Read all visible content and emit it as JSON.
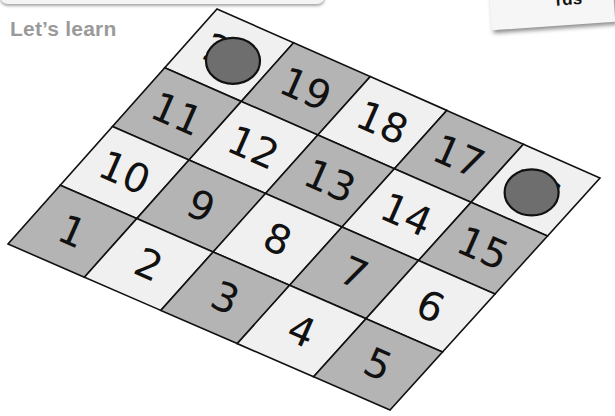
{
  "header": {
    "title": "Let’s learn",
    "card_text": "rds"
  },
  "board": {
    "columns": 5,
    "rows": 4,
    "corners": {
      "top": [
        217,
        9
      ],
      "right": [
        600,
        178
      ],
      "bottom": [
        390,
        410
      ],
      "left": [
        8,
        244
      ]
    },
    "colors": {
      "light": "#f0f0f0",
      "dark": "#b4b4b4",
      "line": "#111111",
      "counter": "#6e6e6e"
    },
    "cells": [
      [
        {
          "n": "20",
          "shade": "light"
        },
        {
          "n": "19",
          "shade": "dark"
        },
        {
          "n": "18",
          "shade": "light"
        },
        {
          "n": "17",
          "shade": "dark"
        },
        {
          "n": "16",
          "shade": "light"
        }
      ],
      [
        {
          "n": "11",
          "shade": "dark"
        },
        {
          "n": "12",
          "shade": "light"
        },
        {
          "n": "13",
          "shade": "dark"
        },
        {
          "n": "14",
          "shade": "light"
        },
        {
          "n": "15",
          "shade": "dark"
        }
      ],
      [
        {
          "n": "10",
          "shade": "light"
        },
        {
          "n": "9",
          "shade": "dark"
        },
        {
          "n": "8",
          "shade": "light"
        },
        {
          "n": "7",
          "shade": "dark"
        },
        {
          "n": "6",
          "shade": "light"
        }
      ],
      [
        {
          "n": "1",
          "shade": "dark"
        },
        {
          "n": "2",
          "shade": "light"
        },
        {
          "n": "3",
          "shade": "dark"
        },
        {
          "n": "4",
          "shade": "light"
        },
        {
          "n": "5",
          "shade": "dark"
        }
      ]
    ],
    "counters": [
      {
        "on": "11",
        "row": 0.5,
        "col": 0.55
      },
      {
        "on": "16",
        "row": 0.5,
        "col": 4.45
      }
    ]
  }
}
